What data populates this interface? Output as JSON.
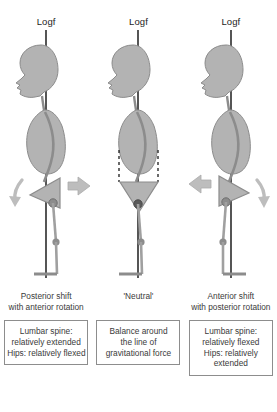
{
  "diagram": {
    "title_hidden": "Sagittal standing posture variations relative to the line of gravitational force",
    "colors": {
      "body_fill": "#b3b3b3",
      "body_stroke": "#8c8c8c",
      "arrow_fill": "#bdbdbd",
      "arrow_stroke": "#a6a6a6",
      "plumb_line": "#2b2b2b",
      "box_border": "#8d8d8d",
      "text": "#3a3a3a",
      "background": "#ffffff"
    },
    "panels": [
      {
        "id": "posterior-shift",
        "logf_label": "Logf",
        "caption_lines": [
          "Posterior shift",
          "with anterior rotation"
        ],
        "summary_lines": [
          "Lumbar spine:",
          "relatively extended",
          "Hips: relatively flexed"
        ],
        "pelvis_orientation": "anteriorly-rotated",
        "arrows": [
          "rotation-arrow-down-left",
          "shift-arrow-right"
        ]
      },
      {
        "id": "neutral",
        "logf_label": "Logf",
        "caption_lines": [
          "'Neutral'"
        ],
        "summary_lines": [
          "Balance around",
          "the line of",
          "gravitational force"
        ],
        "pelvis_orientation": "neutral",
        "arrows": []
      },
      {
        "id": "anterior-shift",
        "logf_label": "Logf",
        "caption_lines": [
          "Anterior shift",
          "with posterior rotation"
        ],
        "summary_lines": [
          "Lumbar spine:",
          "relatively flexed",
          "Hips: relatively",
          "extended"
        ],
        "pelvis_orientation": "posteriorly-rotated",
        "arrows": [
          "shift-arrow-left",
          "rotation-arrow-down-right"
        ]
      }
    ]
  }
}
